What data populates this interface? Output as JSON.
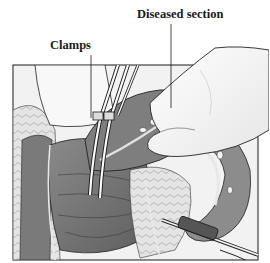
{
  "figure": {
    "labels": {
      "diseased_section": "Diseased section",
      "clamps": "Clamps"
    },
    "elements": [
      "hand holding diseased section",
      "clamps",
      "scissors",
      "intestine",
      "fatty tissue"
    ],
    "colors": {
      "ink": "#1a1a1a",
      "tissue_dark": "#6e6e6e",
      "tissue_mid": "#9a9a9a",
      "tissue_light": "#c8c8c8",
      "background": "#ffffff"
    }
  }
}
